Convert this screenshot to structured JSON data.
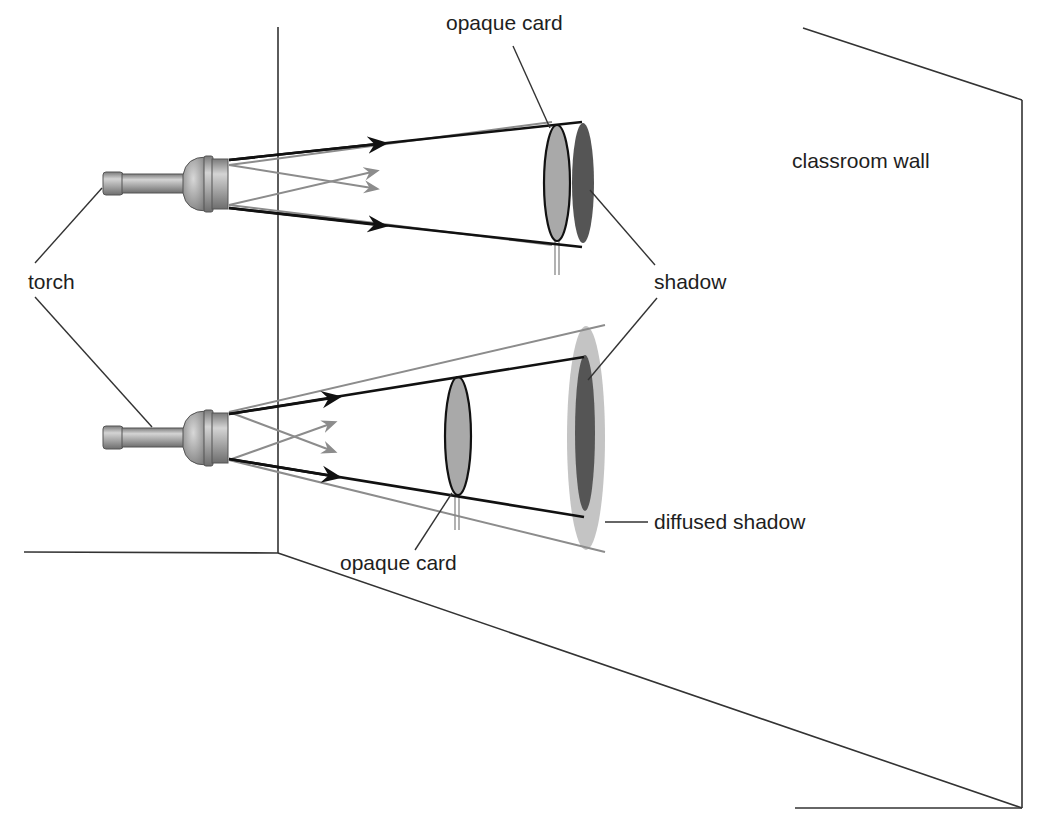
{
  "diagram": {
    "labels": {
      "opaque_card_top": "opaque card",
      "classroom_wall": "classroom wall",
      "torch": "torch",
      "shadow": "shadow",
      "opaque_card_bottom": "opaque card",
      "diffused_shadow": "diffused shadow"
    },
    "scenes": [
      {
        "name": "card near wall",
        "torch": "torch",
        "obstacle": "opaque card",
        "result": "shadow"
      },
      {
        "name": "card far from wall",
        "torch": "torch",
        "obstacle": "opaque card",
        "result": "shadow with diffused shadow (penumbra)"
      }
    ],
    "colors": {
      "line": "#333333",
      "ray_dark": "#111111",
      "ray_light": "#8c8c8c",
      "card_fill": "#a9a9a9",
      "shadow_fill": "#555555",
      "penumbra_fill": "#c4c4c4",
      "torch_metal": "#a8a8a8"
    }
  }
}
